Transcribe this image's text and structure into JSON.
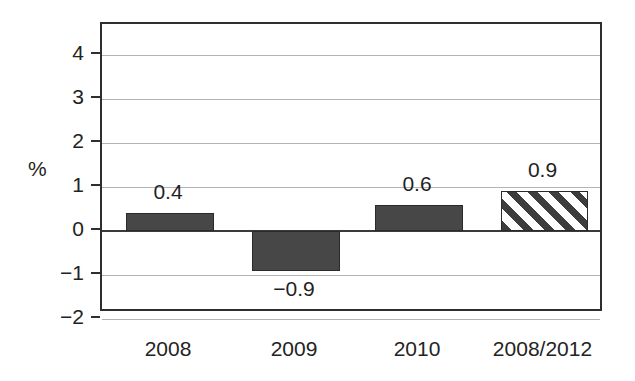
{
  "chart_data": {
    "type": "bar",
    "title": "",
    "subtitle": "",
    "xlabel": "",
    "ylabel": "%",
    "ylim": [
      -2,
      4.7
    ],
    "yticks": [
      4,
      3,
      2,
      1,
      0,
      -1,
      -2
    ],
    "ytick_labels": [
      "4",
      "3",
      "2",
      "1",
      "0",
      "−1",
      "−2"
    ],
    "grid": true,
    "legend": "none",
    "categories": [
      "2008",
      "2009",
      "2010",
      "2008/2012"
    ],
    "values": [
      0.4,
      -0.9,
      0.6,
      0.9
    ],
    "data_labels": [
      "0.4",
      "−0.9",
      "0.6",
      "0.9"
    ],
    "series": [
      {
        "name": "annual change",
        "values": [
          0.4,
          -0.9,
          0.6,
          0.9
        ],
        "fills": [
          "solid",
          "solid",
          "solid",
          "hatched"
        ]
      }
    ],
    "colors": {
      "bar_solid": "#474747",
      "bar_hatch_stroke": "#3d3d3d",
      "bar_hatch_background": "#ffffff",
      "bar_border": "#2a2a2a",
      "gridline": "#b4b4b4",
      "zero_line": "#3a3a3a",
      "frame": "#2e2e2e",
      "text": "#232323",
      "background": "#ffffff"
    }
  },
  "axis": {
    "unit_label": "%"
  }
}
